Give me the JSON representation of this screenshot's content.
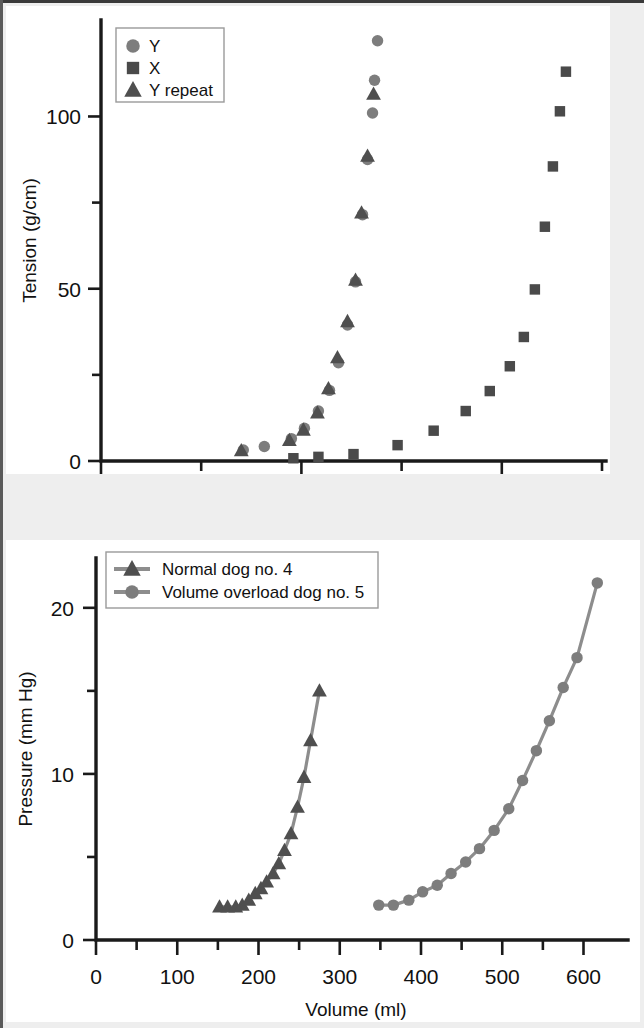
{
  "figure": {
    "background_color": "#eeeeee",
    "panel_color": "#ffffff",
    "frame_color": "#3a3a3a"
  },
  "colors": {
    "marker_circle": "#7d7d7d",
    "marker_square": "#4a4a4a",
    "marker_triangle": "#4f4f4f",
    "curve_line": "#8d8d8d",
    "axis": "#1a1a1a",
    "text": "#111111"
  },
  "chart_data": [
    {
      "type": "scatter",
      "title": "",
      "xlabel": "Stretch ratio",
      "ylabel": "Tension (g/cm)",
      "xlim": [
        0.9,
        1.4
      ],
      "ylim": [
        0,
        128
      ],
      "xticks": [
        0.9,
        1.0,
        1.1,
        1.2,
        1.3,
        1.4
      ],
      "xticklabels": [
        "0.9",
        "",
        "1.1",
        "",
        "1.3",
        ""
      ],
      "xticklabels_major": [
        "0.9",
        "1.1",
        "1.3"
      ],
      "yticks": [
        0,
        25,
        50,
        75,
        100
      ],
      "yticklabels": [
        "0",
        "",
        "50",
        "",
        "100"
      ],
      "yticklabels_major": [
        "0",
        "50",
        "100"
      ],
      "grid": false,
      "legend_position": "top-left",
      "series": [
        {
          "name": "Y",
          "marker": "circle",
          "color": "#7d7d7d",
          "points": [
            [
              1.042,
              3.2
            ],
            [
              1.063,
              4.2
            ],
            [
              1.09,
              6.5
            ],
            [
              1.103,
              9.5
            ],
            [
              1.117,
              14.5
            ],
            [
              1.128,
              20.5
            ],
            [
              1.137,
              28.5
            ],
            [
              1.146,
              39.5
            ],
            [
              1.154,
              52.0
            ],
            [
              1.161,
              71.5
            ],
            [
              1.166,
              87.5
            ],
            [
              1.171,
              101.0
            ],
            [
              1.173,
              110.5
            ],
            [
              1.176,
              122.0
            ]
          ]
        },
        {
          "name": "X",
          "marker": "square",
          "color": "#4a4a4a",
          "points": [
            [
              1.092,
              0.8
            ],
            [
              1.117,
              1.2
            ],
            [
              1.152,
              2.0
            ],
            [
              1.196,
              4.6
            ],
            [
              1.232,
              8.8
            ],
            [
              1.264,
              14.5
            ],
            [
              1.288,
              20.3
            ],
            [
              1.308,
              27.5
            ],
            [
              1.322,
              36.0
            ],
            [
              1.333,
              49.8
            ],
            [
              1.343,
              68.0
            ],
            [
              1.351,
              85.5
            ],
            [
              1.358,
              101.5
            ],
            [
              1.364,
              113.0
            ]
          ]
        },
        {
          "name": "Y repeat",
          "marker": "triangle",
          "color": "#4f4f4f",
          "points": [
            [
              1.04,
              3.0
            ],
            [
              1.088,
              6.0
            ],
            [
              1.102,
              9.0
            ],
            [
              1.116,
              14.0
            ],
            [
              1.127,
              21.0
            ],
            [
              1.136,
              30.0
            ],
            [
              1.146,
              40.5
            ],
            [
              1.154,
              52.5
            ],
            [
              1.16,
              72.0
            ],
            [
              1.166,
              88.5
            ],
            [
              1.172,
              106.5
            ]
          ]
        }
      ],
      "legend": [
        {
          "label": "Y",
          "marker": "circle"
        },
        {
          "label": "X",
          "marker": "square"
        },
        {
          "label": "Y repeat",
          "marker": "triangle"
        }
      ]
    },
    {
      "type": "line",
      "title": "",
      "xlabel": "Volume (ml)",
      "ylabel": "Pressure (mm Hg)",
      "xlim": [
        0,
        640
      ],
      "ylim": [
        0,
        23
      ],
      "xticks": [
        0,
        50,
        100,
        150,
        200,
        250,
        300,
        350,
        400,
        450,
        500,
        550,
        600
      ],
      "xticklabels_major": [
        "0",
        "100",
        "200",
        "300",
        "400",
        "500",
        "600"
      ],
      "yticks": [
        0,
        5,
        10,
        15,
        20
      ],
      "yticklabels_major": [
        "0",
        "10",
        "20"
      ],
      "grid": false,
      "legend_position": "top-left",
      "series": [
        {
          "name": "Normal dog no. 4",
          "marker": "triangle",
          "color": "#4f4f4f",
          "line_color": "#8d8d8d",
          "points": [
            [
              152,
              2.0
            ],
            [
              162,
              2.0
            ],
            [
              172,
              2.0
            ],
            [
              180,
              2.1
            ],
            [
              188,
              2.4
            ],
            [
              196,
              2.8
            ],
            [
              203,
              3.1
            ],
            [
              210,
              3.5
            ],
            [
              218,
              4.0
            ],
            [
              225,
              4.6
            ],
            [
              232,
              5.4
            ],
            [
              240,
              6.4
            ],
            [
              248,
              8.0
            ],
            [
              256,
              9.8
            ],
            [
              264,
              12.0
            ],
            [
              275,
              15.0
            ]
          ]
        },
        {
          "name": "Volume overload dog no. 5",
          "marker": "circle",
          "color": "#7d7d7d",
          "line_color": "#8d8d8d",
          "points": [
            [
              348,
              2.1
            ],
            [
              366,
              2.1
            ],
            [
              385,
              2.4
            ],
            [
              402,
              2.9
            ],
            [
              420,
              3.3
            ],
            [
              437,
              4.0
            ],
            [
              455,
              4.7
            ],
            [
              472,
              5.5
            ],
            [
              490,
              6.6
            ],
            [
              508,
              7.9
            ],
            [
              525,
              9.6
            ],
            [
              542,
              11.4
            ],
            [
              558,
              13.2
            ],
            [
              575,
              15.2
            ],
            [
              592,
              17.0
            ],
            [
              617,
              21.5
            ]
          ]
        }
      ],
      "legend": [
        {
          "label": "Normal dog no. 4",
          "marker": "triangle"
        },
        {
          "label": "Volume overload dog no. 5",
          "marker": "circle"
        }
      ]
    }
  ]
}
